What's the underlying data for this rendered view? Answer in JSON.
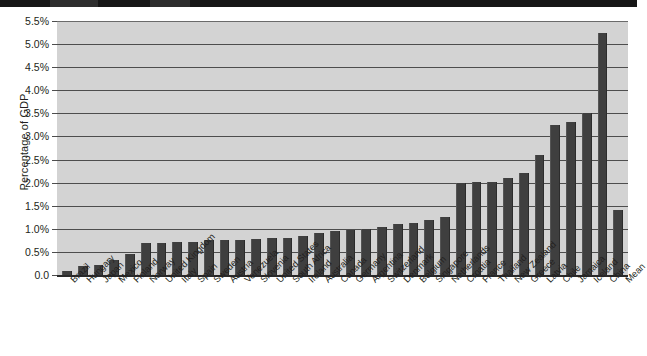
{
  "chart_data": {
    "type": "bar",
    "title": "",
    "xlabel": "",
    "ylabel": "Percentage of GDP",
    "ylim": [
      0,
      5.5
    ],
    "grid": true,
    "legend": "none",
    "bar_color": "#3f3f3f",
    "plot_background": "#d3d3d3",
    "y_tick_labels": [
      "5.5%",
      "5.0%",
      "4.5%",
      "4.0%",
      "3.5%",
      "3.0%",
      "2.5%",
      "2.0%",
      "1.5%",
      "1.0%",
      "0.5%",
      "0.0"
    ],
    "y_tick_values": [
      5.5,
      5.0,
      4.5,
      4.0,
      3.5,
      3.0,
      2.5,
      2.0,
      1.5,
      1.0,
      0.5,
      0.0
    ],
    "categories": [
      "Brazil",
      "Hungary",
      "Japan",
      "Mexico",
      "Finland",
      "Norway",
      "United Kingdom",
      "Italy",
      "Spain",
      "Sweden",
      "Austria",
      "Venezuela",
      "Slovenia",
      "United States",
      "South Africa",
      "Ireland",
      "Australia",
      "Canada",
      "Germany",
      "Argentina",
      "Switzerland",
      "Denmark",
      "Belgium",
      "Singapore",
      "Netherlands",
      "Croatia",
      "France",
      "Thailand",
      "New Zealand",
      "Greece",
      "Latvia",
      "Chile",
      "Jamaica",
      "Iceland",
      "China",
      "Mean"
    ],
    "values": [
      0.08,
      0.2,
      0.22,
      0.32,
      0.45,
      0.7,
      0.7,
      0.72,
      0.72,
      0.75,
      0.75,
      0.75,
      0.78,
      0.8,
      0.8,
      0.85,
      0.9,
      0.95,
      0.98,
      1.0,
      1.05,
      1.1,
      1.12,
      1.2,
      1.25,
      2.0,
      2.02,
      2.02,
      2.1,
      2.2,
      2.6,
      3.25,
      3.32,
      3.5,
      5.25,
      1.4
    ]
  },
  "axis": {
    "y_title": "Percentage of GDP"
  }
}
